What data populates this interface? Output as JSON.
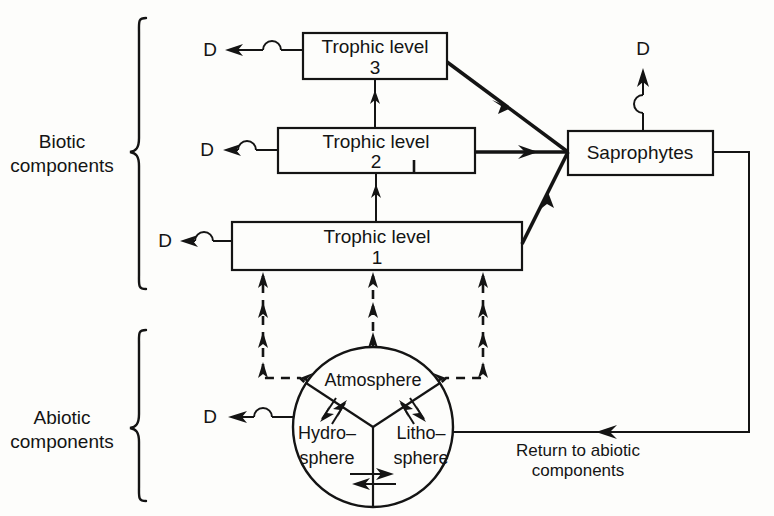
{
  "diagram": {
    "background_color": "#fdfdfb",
    "ink_color": "#141414"
  },
  "group_labels": {
    "biotic_line1": "Biotic",
    "biotic_line2": "components",
    "abiotic_line1": "Abiotic",
    "abiotic_line2": "components"
  },
  "boxes": {
    "trophic3": {
      "line1": "Trophic level",
      "line2": "3"
    },
    "trophic2": {
      "line1": "Trophic level",
      "line2": "2"
    },
    "trophic1": {
      "line1": "Trophic level",
      "line2": "1"
    },
    "saprophytes": {
      "line1": "Saprophytes"
    }
  },
  "sphere": {
    "atmosphere": "Atmosphere",
    "hydrosphere_line1": "Hydro–",
    "hydrosphere_line2": "sphere",
    "lithosphere_line1": "Litho–",
    "lithosphere_line2": "sphere"
  },
  "loss_labels": {
    "d_trophic3": "D",
    "d_trophic2": "D",
    "d_trophic1": "D",
    "d_saprophytes": "D",
    "d_hydrosphere": "D"
  },
  "return_path": {
    "line1": "Return to abiotic",
    "line2": "components"
  }
}
